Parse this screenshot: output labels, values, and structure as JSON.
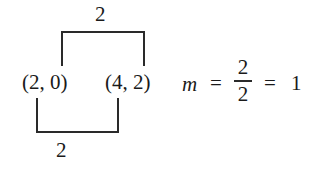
{
  "diagram": {
    "points": [
      {
        "label": "(2, 0)",
        "x": 2,
        "y": 0
      },
      {
        "label": "(4, 2)",
        "x": 4,
        "y": 2
      }
    ],
    "top_bracket": {
      "label": "2",
      "meaning": "rise"
    },
    "bottom_bracket": {
      "label": "2",
      "meaning": "run"
    },
    "equation": {
      "variable": "m",
      "equals1": "=",
      "numerator": "2",
      "denominator": "2",
      "equals2": "=",
      "result": "1"
    }
  }
}
